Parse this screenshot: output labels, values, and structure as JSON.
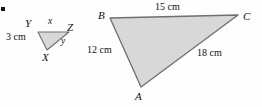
{
  "figure": {
    "type": "geometry-diagram",
    "background_color": "#fefefe",
    "fill_color": "#d8d8d8",
    "stroke_color": "#6f6f6f",
    "text_color": "#121212",
    "bullet_marker": "bullet-mark",
    "small_triangle": {
      "name": "triangle-xyz",
      "vertices": [
        {
          "label": "Y",
          "x": 38,
          "y": 32,
          "label_x": 25,
          "label_y": 18
        },
        {
          "label": "Z",
          "x": 69,
          "y": 32,
          "label_x": 67,
          "label_y": 22
        },
        {
          "label": "X",
          "x": 47,
          "y": 50,
          "label_x": 42,
          "label_y": 52
        }
      ],
      "sides": [
        {
          "label": "x",
          "style": "var-lbl",
          "x": 48,
          "y": 17
        },
        {
          "label": "y",
          "style": "var-lbl",
          "x": 61,
          "y": 37
        },
        {
          "label": "3 cm",
          "style": "side-lbl",
          "x": 6,
          "y": 32
        }
      ]
    },
    "large_triangle": {
      "name": "triangle-abc",
      "vertices": [
        {
          "label": "B",
          "x": 110,
          "y": 18,
          "label_x": 98,
          "label_y": 10
        },
        {
          "label": "C",
          "x": 238,
          "y": 15,
          "label_x": 243,
          "label_y": 11
        },
        {
          "label": "A",
          "x": 141,
          "y": 87,
          "label_x": 135,
          "label_y": 91
        }
      ],
      "sides": [
        {
          "label": "15 cm",
          "style": "side-lbl",
          "x": 155,
          "y": 2
        },
        {
          "label": "12 cm",
          "style": "side-lbl",
          "x": 87,
          "y": 45
        },
        {
          "label": "18 cm",
          "style": "side-lbl",
          "x": 197,
          "y": 48
        }
      ]
    }
  }
}
